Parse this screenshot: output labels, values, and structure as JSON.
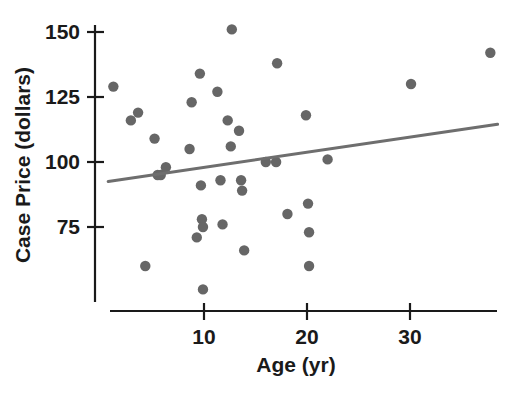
{
  "chart_data": {
    "type": "scatter",
    "title": "",
    "xlabel": "Age (yr)",
    "ylabel": "Case Price (dollars)",
    "xlim": [
      0,
      38.5
    ],
    "ylim": [
      45,
      155
    ],
    "xticks": [
      10,
      20,
      30
    ],
    "xtick_labels": [
      "10",
      "20",
      "30"
    ],
    "yticks": [
      75,
      100,
      125,
      150
    ],
    "ytick_labels": [
      "75",
      "100",
      "125",
      "150"
    ],
    "grid": false,
    "legend": "none",
    "point_color": "#666666",
    "line_color": "#6e6e6e",
    "axis_color": "#1a1a1a",
    "points": [
      {
        "x": 1.2,
        "y": 129
      },
      {
        "x": 2.9,
        "y": 116
      },
      {
        "x": 3.6,
        "y": 119
      },
      {
        "x": 4.3,
        "y": 60
      },
      {
        "x": 5.2,
        "y": 109
      },
      {
        "x": 5.5,
        "y": 95
      },
      {
        "x": 5.8,
        "y": 95
      },
      {
        "x": 6.3,
        "y": 98
      },
      {
        "x": 8.6,
        "y": 105
      },
      {
        "x": 8.8,
        "y": 123
      },
      {
        "x": 9.6,
        "y": 134
      },
      {
        "x": 9.7,
        "y": 91
      },
      {
        "x": 9.8,
        "y": 78
      },
      {
        "x": 9.9,
        "y": 75
      },
      {
        "x": 9.3,
        "y": 71
      },
      {
        "x": 9.9,
        "y": 51
      },
      {
        "x": 11.3,
        "y": 127
      },
      {
        "x": 11.6,
        "y": 93
      },
      {
        "x": 11.8,
        "y": 76
      },
      {
        "x": 12.3,
        "y": 116
      },
      {
        "x": 12.6,
        "y": 106
      },
      {
        "x": 12.7,
        "y": 151
      },
      {
        "x": 13.4,
        "y": 112
      },
      {
        "x": 13.6,
        "y": 93
      },
      {
        "x": 13.7,
        "y": 89
      },
      {
        "x": 13.9,
        "y": 66
      },
      {
        "x": 16.0,
        "y": 100
      },
      {
        "x": 17.0,
        "y": 100
      },
      {
        "x": 17.1,
        "y": 138
      },
      {
        "x": 18.1,
        "y": 80
      },
      {
        "x": 19.9,
        "y": 118
      },
      {
        "x": 20.1,
        "y": 84
      },
      {
        "x": 20.2,
        "y": 73
      },
      {
        "x": 20.2,
        "y": 60
      },
      {
        "x": 22.0,
        "y": 101
      },
      {
        "x": 30.1,
        "y": 130
      },
      {
        "x": 37.8,
        "y": 142
      }
    ],
    "trend_line": {
      "x0": 0.7,
      "y0": 92.5,
      "x1": 38.5,
      "y1": 114.5
    }
  }
}
